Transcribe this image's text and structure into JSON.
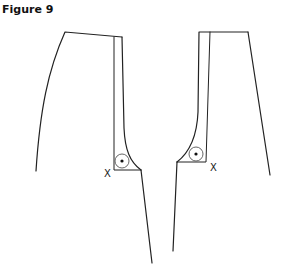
{
  "figure": {
    "title": "Figure 9",
    "labels": {
      "left_x": "X",
      "right_x": "X"
    }
  }
}
